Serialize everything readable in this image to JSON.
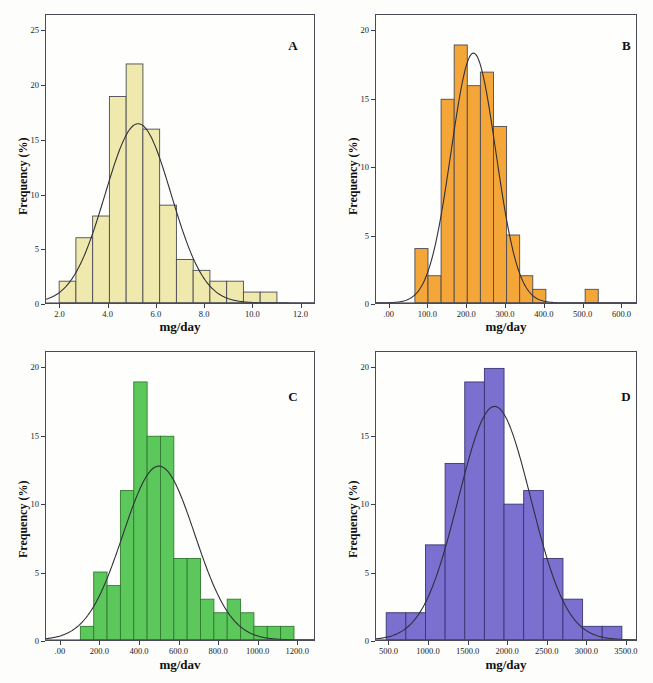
{
  "figure": {
    "background_color": "#fdfdfb",
    "axis_color": "#4a4a55",
    "curve_color": "#2f2f3a"
  },
  "panels": [
    {
      "letter": "A",
      "xlabel": "mg/day",
      "ylabel": "Frequency (%)",
      "color": "#efe9ad"
    },
    {
      "letter": "B",
      "xlabel": "mg/day",
      "ylabel": "Frequency (%)",
      "color": "#f5a639"
    },
    {
      "letter": "C",
      "xlabel": "mg/dav",
      "ylabel": "Frequency (%)",
      "color": "#5cc85c"
    },
    {
      "letter": "D",
      "xlabel": "mg/day",
      "ylabel": "Frequency (%)",
      "color": "#7b6fd0"
    }
  ],
  "chart_data": [
    {
      "type": "bar",
      "panel": "A",
      "title": "",
      "xlabel": "mg/day",
      "ylabel": "Frequency (%)",
      "bar_color": "#efe9ad",
      "edge_color": "#4a4a55",
      "grid": false,
      "legend": null,
      "xlim": [
        1.4,
        12.6
      ],
      "ylim": [
        0,
        26.5
      ],
      "xticks": [
        2.0,
        4.0,
        6.0,
        8.0,
        10.0,
        12.0
      ],
      "xticklabels": [
        "2.0",
        "4.0",
        "6.0",
        "8.0",
        "10.0",
        "12.0"
      ],
      "yticks": [
        0,
        5,
        10,
        15,
        20,
        25
      ],
      "yticklabels": [
        "0",
        "5",
        "10",
        "15",
        "20",
        "25"
      ],
      "bin_width": 0.7,
      "bin_starts": [
        1.95,
        2.65,
        3.35,
        4.05,
        4.75,
        5.45,
        6.15,
        6.85,
        7.55,
        8.25,
        8.95,
        9.65,
        10.35
      ],
      "values": [
        2,
        6,
        8,
        19,
        22,
        16,
        9,
        4,
        3,
        2,
        2,
        1,
        1
      ],
      "normal_curve": {
        "mean": 5.25,
        "sd": 1.38,
        "peak": 16.5
      }
    },
    {
      "type": "bar",
      "panel": "B",
      "title": "",
      "xlabel": "mg/day",
      "ylabel": "Frequency (%)",
      "bar_color": "#f5a639",
      "edge_color": "#4a4a55",
      "grid": false,
      "legend": null,
      "xlim": [
        -35,
        640
      ],
      "ylim": [
        0,
        21.2
      ],
      "xticks": [
        0,
        100,
        200,
        300,
        400,
        500,
        600
      ],
      "xticklabels": [
        ".00",
        "100.0",
        "200.0",
        "300.0",
        "400.0",
        "500.0",
        "600.0"
      ],
      "yticks": [
        0,
        5,
        10,
        15,
        20
      ],
      "yticklabels": [
        "0",
        "5",
        "10",
        "15",
        "20"
      ],
      "bin_width": 34,
      "bin_starts": [
        66,
        100,
        134,
        168,
        202,
        236,
        270,
        304,
        338,
        372,
        508
      ],
      "values": [
        4,
        2,
        15,
        19,
        16,
        17,
        13,
        5,
        2,
        1,
        1
      ],
      "normal_curve": {
        "mean": 218,
        "sd": 58,
        "peak": 18.4
      }
    },
    {
      "type": "bar",
      "panel": "C",
      "title": "",
      "xlabel": "mg/dav",
      "ylabel": "Frequency (%)",
      "bar_color": "#5cc85c",
      "edge_color": "#2f7a2f",
      "grid": false,
      "legend": null,
      "xlim": [
        -75,
        1290
      ],
      "ylim": [
        0,
        21.2
      ],
      "xticks": [
        0,
        200,
        400,
        600,
        800,
        1000,
        1200
      ],
      "xticklabels": [
        ".00",
        "200.0",
        "400.0",
        "600.0",
        "800.0",
        "1000.0",
        "1200.0"
      ],
      "yticks": [
        0,
        5,
        10,
        15,
        20
      ],
      "yticklabels": [
        "0",
        "5",
        "10",
        "15",
        "20"
      ],
      "bin_width": 68,
      "bin_starts": [
        100,
        168,
        236,
        304,
        372,
        440,
        508,
        576,
        644,
        712,
        780,
        848,
        916,
        984,
        1052,
        1120
      ],
      "values": [
        1,
        5,
        4,
        11,
        19,
        15,
        15,
        6,
        6,
        3,
        2,
        3,
        2,
        1,
        1,
        1
      ],
      "normal_curve": {
        "mean": 500,
        "sd": 183,
        "peak": 12.8
      }
    },
    {
      "type": "bar",
      "panel": "D",
      "title": "",
      "xlabel": "mg/day",
      "ylabel": "Frequency (%)",
      "bar_color": "#7b6fd0",
      "edge_color": "#3b3470",
      "grid": false,
      "legend": null,
      "xlim": [
        330,
        3640
      ],
      "ylim": [
        0,
        21.2
      ],
      "xticks": [
        500,
        1000,
        1500,
        2000,
        2500,
        3000,
        3500
      ],
      "xticklabels": [
        "500.0",
        "1000.0",
        "1500.0",
        "2000.0",
        "2500.0",
        "3000.0",
        "3500.0"
      ],
      "yticks": [
        0,
        5,
        10,
        15,
        20
      ],
      "yticklabels": [
        "0",
        "5",
        "10",
        "15",
        "20"
      ],
      "bin_width": 250,
      "bin_starts": [
        460,
        710,
        960,
        1210,
        1460,
        1710,
        1960,
        2210,
        2460,
        2710,
        2960,
        3210
      ],
      "values": [
        2,
        2,
        7,
        13,
        19,
        20,
        10,
        11,
        6,
        3,
        1,
        1
      ],
      "normal_curve": {
        "mean": 1840,
        "sd": 460,
        "peak": 17.2
      }
    }
  ]
}
